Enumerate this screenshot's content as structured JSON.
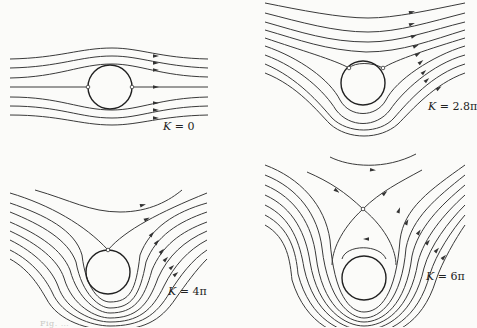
{
  "figure": {
    "stroke_color": "#3a3a3a",
    "background": "#fbfbf9",
    "panels": [
      {
        "id": "k0",
        "label_var": "K",
        "label_value": "= 0",
        "label_pos": [
          163,
          120
        ],
        "cylinder": {
          "cx": 110,
          "cy": 87,
          "r": 22
        },
        "stagnation_points": [
          [
            88,
            87
          ],
          [
            132,
            87
          ]
        ],
        "streamlines": [
          "M10,59 C60,58 80,48 112,48 C140,48 160,58 208,59",
          "M10,68 C60,67 80,56 112,56 C140,56 160,66 208,68",
          "M10,78 C60,77 80,64 112,64 C140,64 160,76 208,77",
          "M10,87 L88,87 M132,87 L208,87",
          "M10,97 C60,97 80,110 112,110 C140,110 160,98 208,97",
          "M10,106 C60,106 80,118 112,118 C140,118 160,107 208,106",
          "M10,115 C60,115 80,125 112,125 C140,125 160,116 208,115"
        ],
        "arrows": [
          [
            156,
            56,
            0
          ],
          [
            156,
            63,
            0
          ],
          [
            156,
            70,
            0
          ],
          [
            156,
            87,
            0
          ],
          [
            156,
            103,
            0
          ],
          [
            156,
            110,
            0
          ],
          [
            156,
            118,
            0
          ]
        ]
      },
      {
        "id": "k2_8pi",
        "label_var": "K",
        "label_value": "= 2.8π",
        "label_pos": [
          428,
          100
        ],
        "cylinder": {
          "cx": 363,
          "cy": 83,
          "r": 22
        },
        "stagnation_points": [
          [
            349,
            68
          ],
          [
            383,
            68
          ]
        ],
        "streamlines": [
          "M265,3 C300,10 340,18 368,18 C395,18 430,10 465,3",
          "M265,13 C300,22 335,32 368,32 C398,32 430,22 465,13",
          "M265,22 C300,32 330,42 368,42 C400,42 432,30 465,22",
          "M265,30 C300,40 325,50 366,52 C402,52 432,40 465,30",
          "M265,38 C300,50 335,60 349,68 C355,62 372,62 383,68 C395,60 432,48 465,38",
          "M265,46 C300,58 330,80 340,100 C350,118 376,118 386,100 C396,80 432,56 465,46",
          "M265,55 C300,68 325,92 336,110 C350,128 376,128 390,110 C402,92 432,64 465,55",
          "M265,64 C298,78 320,104 332,118 C348,134 380,134 394,118 C408,102 432,74 465,64",
          "M265,73 C298,86 318,112 330,124 C348,140 380,140 398,124 C412,110 434,84 465,73"
        ],
        "arrows": [
          [
            412,
            12,
            -0.25
          ],
          [
            412,
            24,
            -0.3
          ],
          [
            414,
            36,
            -0.35
          ],
          [
            416,
            46,
            -0.4
          ],
          [
            418,
            54,
            -0.55
          ],
          [
            421,
            62,
            -0.7
          ],
          [
            424,
            72,
            -0.75
          ],
          [
            427,
            80,
            -0.75
          ],
          [
            439,
            88,
            -0.6
          ]
        ]
      },
      {
        "id": "k4pi",
        "label_var": "K",
        "label_value": "= 4π",
        "label_pos": [
          168,
          285
        ],
        "cylinder": {
          "cx": 108,
          "cy": 272,
          "r": 22
        },
        "stagnation_points": [
          [
            108,
            250
          ]
        ],
        "streamlines": [
          "M35,190 C70,200 90,212 120,212 C150,212 170,200 182,190",
          "M10,193 C50,205 85,225 108,250 C125,230 160,212 207,193",
          "M10,203 C45,215 75,230 82,255 C86,290 100,302 110,302 C130,302 136,290 140,255 C150,228 175,212 207,203",
          "M10,212 C42,225 68,240 76,262 C82,295 100,308 110,308 C132,308 140,295 146,262 C156,236 178,222 207,212",
          "M10,222 C40,235 62,250 70,270 C78,300 98,313 110,313 C134,313 144,300 152,270 C162,246 180,232 207,222",
          "M10,231 C38,244 58,260 64,278 C72,306 96,318 110,318 C136,318 148,306 158,278 C168,256 184,241 207,231",
          "M10,240 C36,253 52,270 58,286 C66,311 94,322 110,322 C138,322 152,311 164,286 C174,266 188,250 207,240",
          "M10,250 C34,262 46,280 52,292 C62,316 92,326 110,326 C140,326 156,316 170,292 C180,276 192,260 207,250",
          "M10,259 C30,270 40,288 46,298 C58,322 90,330 110,330 C142,330 160,322 176,298 C186,284 196,270 207,259"
        ],
        "arrows": [
          [
            143,
            205,
            -0.25
          ],
          [
            147,
            219,
            -0.5
          ],
          [
            152,
            234,
            -0.9
          ],
          [
            157,
            242,
            -0.9
          ],
          [
            162,
            251,
            -0.85
          ],
          [
            166,
            259,
            -0.8
          ],
          [
            172,
            267,
            -0.75
          ],
          [
            176,
            274,
            -0.7
          ]
        ]
      },
      {
        "id": "k6pi",
        "label_var": "K",
        "label_value": "= 6π",
        "label_pos": [
          426,
          270
        ],
        "cylinder": {
          "cx": 364,
          "cy": 278,
          "r": 22
        },
        "stagnation_points": [
          [
            363,
            209
          ]
        ],
        "streamlines": [
          "M330,157 C350,167 385,170 416,154",
          "M307,172 C330,182 345,192 363,209 C380,192 400,182 422,170",
          "M363,209 C340,230 332,252 332,265 M363,209 C388,230 396,252 396,265",
          "M342,259 C346,244 380,244 386,259",
          "M265,165 C300,178 325,205 330,240 C334,295 350,312 364,312 C380,312 396,295 400,240 C404,208 430,190 465,165",
          "M265,175 C298,188 318,215 322,248 C328,300 350,318 364,318 C380,318 402,300 406,248 C412,218 436,198 465,175",
          "M265,185 C296,198 312,225 316,256 C322,306 348,322 364,322 C382,322 406,306 412,256 C418,228 440,206 465,185",
          "M265,195 C294,208 306,235 310,262 C318,310 346,326 364,326 C384,326 410,310 418,262 C424,238 444,214 465,195",
          "M265,205 C292,218 300,244 304,268 C314,314 344,330 364,330 C386,330 414,314 424,268 C430,246 448,222 465,205",
          "M265,215 C290,228 296,252 298,274 C310,320 342,334 364,334 C388,334 418,320 430,274 C436,254 452,230 465,215",
          "M265,225 C288,238 290,262 292,280 C306,326 340,338 364,338 C390,338 422,326 436,280 C442,262 456,238 465,225"
        ],
        "arrows": [
          [
            373,
            170,
            0.1
          ],
          [
            337,
            191,
            0.6
          ],
          [
            385,
            193,
            -0.7
          ],
          [
            366,
            239,
            3.14
          ],
          [
            399,
            210,
            -1.2
          ],
          [
            407,
            222,
            -1.1
          ],
          [
            419,
            232,
            -1.0
          ],
          [
            428,
            242,
            -0.9
          ],
          [
            437,
            250,
            -0.85
          ],
          [
            444,
            257,
            -0.8
          ]
        ]
      }
    ]
  },
  "caption": "Fig. …"
}
